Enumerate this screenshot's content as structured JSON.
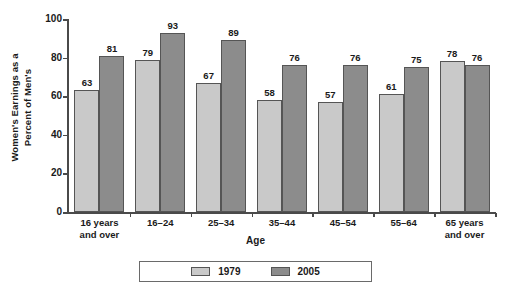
{
  "chart_data": {
    "type": "bar",
    "title": "",
    "subtitle": "",
    "xlabel": "Age",
    "ylabel": "Women's Earnings as a Percent of Men's",
    "ylabel_line1": "Women's Earnings as a",
    "ylabel_line2": "Percent of Men's",
    "ylim": [
      0,
      100
    ],
    "yticks": [
      0,
      20,
      40,
      60,
      80,
      100
    ],
    "ytick_labels": [
      "0",
      "20",
      "40",
      "60",
      "80",
      "100"
    ],
    "grid": false,
    "legend_position": "bottom",
    "categories": [
      "16 years and over",
      "16–24",
      "25–34",
      "35–44",
      "45–54",
      "55–64",
      "65 years and over"
    ],
    "category_lines": [
      [
        "16 years",
        "and over"
      ],
      [
        "16–24",
        ""
      ],
      [
        "25–34",
        ""
      ],
      [
        "35–44",
        ""
      ],
      [
        "45–54",
        ""
      ],
      [
        "55–64",
        ""
      ],
      [
        "65 years",
        "and over"
      ]
    ],
    "series": [
      {
        "name": "1979",
        "color": "#c9c9c9",
        "values": [
          63,
          79,
          67,
          58,
          57,
          61,
          78
        ],
        "labels": [
          "63",
          "79",
          "67",
          "58",
          "57",
          "61",
          "78"
        ]
      },
      {
        "name": "2005",
        "color": "#8c8c8c",
        "values": [
          81,
          93,
          89,
          76,
          76,
          75,
          76
        ],
        "labels": [
          "81",
          "93",
          "89",
          "76",
          "76",
          "75",
          "76"
        ]
      }
    ]
  },
  "legend": {
    "items": [
      {
        "label": "1979",
        "color": "#c9c9c9"
      },
      {
        "label": "2005",
        "color": "#8c8c8c"
      }
    ]
  },
  "colors": {
    "series_1979": "#c9c9c9",
    "series_2005": "#8c8c8c",
    "bar_border": "#555555",
    "axis": "#4a4a4a",
    "text": "#1a1a1a",
    "background": "#ffffff"
  }
}
